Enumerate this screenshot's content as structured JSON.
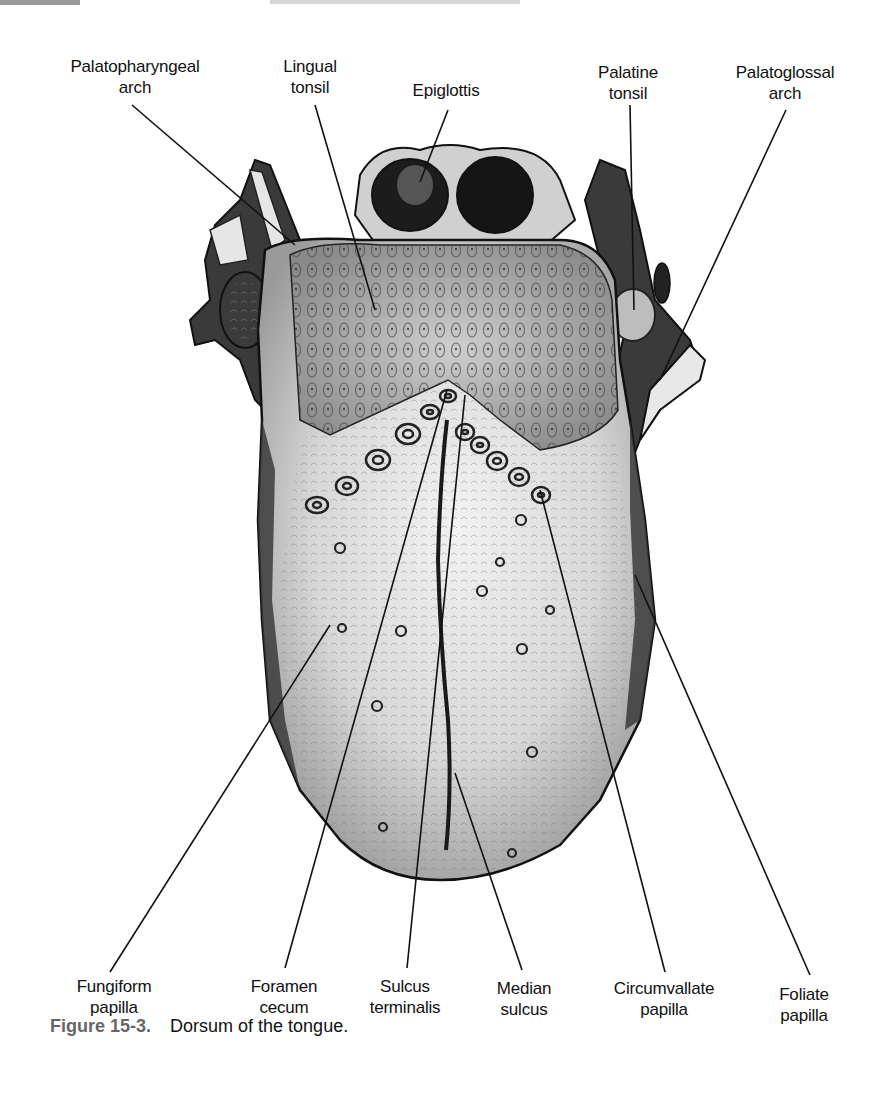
{
  "figure": {
    "title": "Dorsum of the tongue",
    "labels_top": [
      {
        "id": "palatopharyngeal-arch",
        "line1": "Palatopharyngeal",
        "line2": "arch"
      },
      {
        "id": "lingual-tonsil",
        "line1": "Lingual",
        "line2": "tonsil"
      },
      {
        "id": "epiglottis",
        "line1": "Epiglottis",
        "line2": ""
      },
      {
        "id": "palatine-tonsil",
        "line1": "Palatine",
        "line2": "tonsil"
      },
      {
        "id": "palatoglossal-arch",
        "line1": "Palatoglossal",
        "line2": "arch"
      }
    ],
    "labels_bottom": [
      {
        "id": "fungiform-papilla",
        "line1": "Fungiform",
        "line2": "papilla"
      },
      {
        "id": "foramen-cecum",
        "line1": "Foramen",
        "line2": "cecum"
      },
      {
        "id": "sulcus-terminalis",
        "line1": "Sulcus",
        "line2": "terminalis"
      },
      {
        "id": "median-sulcus",
        "line1": "Median",
        "line2": "sulcus"
      },
      {
        "id": "circumvallate-papilla",
        "line1": "Circumvallate",
        "line2": "papilla"
      },
      {
        "id": "foliate-papilla",
        "line1": "Foliate",
        "line2": "papilla"
      }
    ],
    "caption": {
      "number": "Figure 15-3.",
      "text": "Dorsum of the tongue."
    }
  }
}
